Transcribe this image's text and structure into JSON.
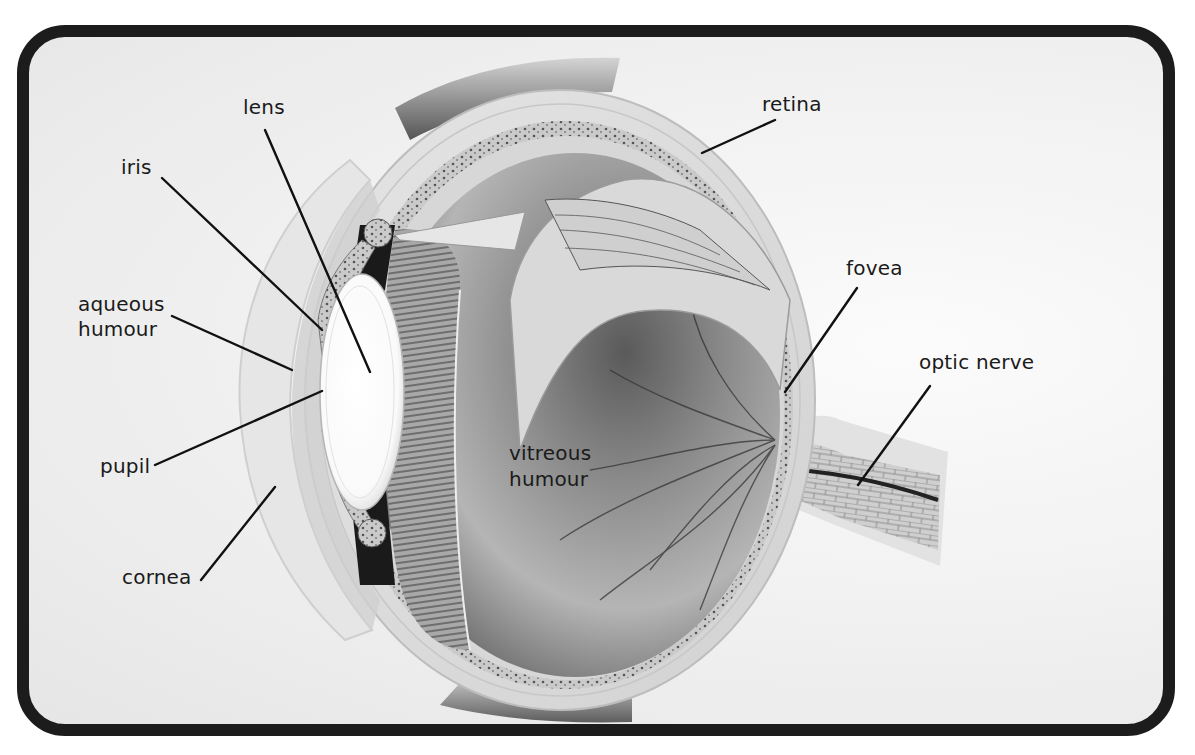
{
  "diagram": {
    "colors": {
      "frame_border": "#1c1c1c",
      "background": "#f0f0f0",
      "label_text": "#1a1a1a",
      "leader_line": "#111111"
    },
    "labels": {
      "lens": "lens",
      "iris": "iris",
      "aqueous_humour_line1": "aqueous",
      "aqueous_humour_line2": "humour",
      "pupil": "pupil",
      "cornea": "cornea",
      "retina": "retina",
      "fovea": "fovea",
      "optic_nerve": "optic nerve",
      "vitreous_humour_line1": "vitreous",
      "vitreous_humour_line2": "humour"
    }
  }
}
